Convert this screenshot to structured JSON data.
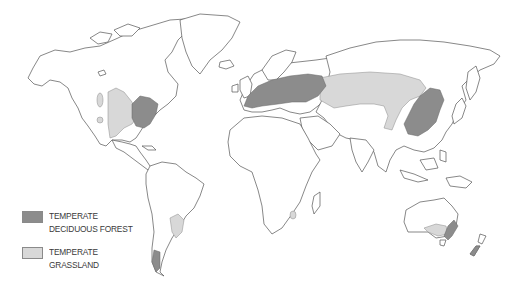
{
  "legend": {
    "items": [
      {
        "label": "TEMPERATE DECIDUOUS FOREST",
        "color": "#8c8c8c"
      },
      {
        "label": "TEMPERATE GRASSLAND",
        "color": "#d8d8d8"
      }
    ]
  },
  "colors": {
    "land_fill": "#ffffff",
    "coastline": "#555555",
    "forest": "#8c8c8c",
    "grassland": "#d8d8d8",
    "background": "#ffffff"
  }
}
